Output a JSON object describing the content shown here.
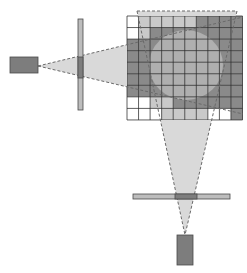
{
  "diagram": {
    "colors": {
      "background": "#ffffff",
      "cell_white": "#ffffff",
      "cell_light": "#c9c9c9",
      "cell_dark": "#8a8a8a",
      "grid_line": "#2a2a2a",
      "cone_fill": "#d9d9d9",
      "cone_edge": "#6a6a6a",
      "circle_fill": "#b3b3b3",
      "source_fill": "#7d7d7d",
      "source_stroke": "#4a4a4a",
      "filter_fill": "#bdbdbd",
      "filter_overlap": "#7d7d7d"
    },
    "grid": {
      "x": 127,
      "y": 16,
      "cols": 10,
      "rows": 9,
      "cell": 11.55,
      "cells": [
        [
          "W",
          "L",
          "L",
          "L",
          "L",
          "L",
          "D",
          "D",
          "D",
          "D"
        ],
        [
          "W",
          "L",
          "D",
          "D",
          "D",
          "D",
          "D",
          "D",
          "D",
          "D"
        ],
        [
          "D",
          "D",
          "D",
          "D",
          "D",
          "D",
          "D",
          "D",
          "D",
          "D"
        ],
        [
          "D",
          "D",
          "D",
          "D",
          "D",
          "D",
          "D",
          "D",
          "D",
          "D"
        ],
        [
          "D",
          "D",
          "D",
          "D",
          "D",
          "D",
          "D",
          "D",
          "D",
          "D"
        ],
        [
          "D",
          "D",
          "D",
          "D",
          "D",
          "D",
          "D",
          "D",
          "D",
          "D"
        ],
        [
          "D",
          "D",
          "D",
          "D",
          "D",
          "D",
          "D",
          "D",
          "D",
          "D"
        ],
        [
          "W",
          "W",
          "L",
          "L",
          "D",
          "D",
          "D",
          "D",
          "D",
          "D"
        ],
        [
          "W",
          "W",
          "W",
          "L",
          "L",
          "L",
          "L",
          "W",
          "W",
          "D"
        ]
      ]
    },
    "overlap_circle": {
      "cx": 186,
      "cy": 65,
      "rx": 37,
      "ry": 35
    },
    "left_source": {
      "x": 10,
      "y": 57,
      "w": 28,
      "h": 16
    },
    "left_filter": {
      "x": 78,
      "y": 19,
      "w": 5,
      "h": 91,
      "overlap_y1": 57,
      "overlap_y2": 78
    },
    "left_beam": {
      "apex": [
        38,
        66
      ],
      "edge_top_end": [
        243,
        17
      ],
      "edge_bottom_end": [
        243,
        114
      ]
    },
    "bottom_source": {
      "x": 177,
      "y": 235,
      "w": 16,
      "h": 30
    },
    "bottom_filter": {
      "x": 133,
      "y": 194,
      "w": 97,
      "h": 5,
      "overlap_x1": 175,
      "overlap_x2": 197
    },
    "bottom_beam": {
      "apex": [
        185,
        235
      ],
      "top_left": [
        137,
        11
      ],
      "top_right": [
        237,
        11
      ]
    }
  }
}
